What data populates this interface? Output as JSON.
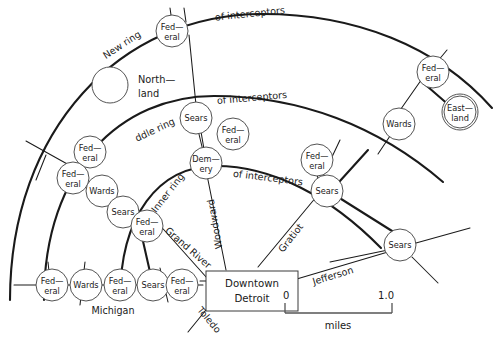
{
  "figure": {
    "kind": "ring-road-network-map",
    "region": "Detroit",
    "background_color": "#ffffff",
    "line_color": "#1a1a1a",
    "node_fill": "#ffffff",
    "node_stroke": "#4a4a4a"
  },
  "center": {
    "label_line1": "Downtown",
    "label_line2": "Detroit"
  },
  "rings": [
    {
      "id": "new-ring",
      "label": "New ring",
      "suffix_label": "of interceptors"
    },
    {
      "id": "middle-ring",
      "label": "ddle ring",
      "suffix_label": "of interceptors"
    },
    {
      "id": "inner-ring",
      "label": "Inner ring",
      "suffix_label": "of interceptors"
    }
  ],
  "radials": [
    {
      "id": "michigan",
      "label": "Michigan"
    },
    {
      "id": "grand-river",
      "label": "Grand River"
    },
    {
      "id": "woodward",
      "label": "Woodward"
    },
    {
      "id": "gratiot",
      "label": "Gratiot"
    },
    {
      "id": "jefferson",
      "label": "Jefferson"
    },
    {
      "id": "toledo",
      "label": "Toledo"
    }
  ],
  "unlabeled_circles": [
    {
      "id": "northland-circle",
      "note": "northland"
    },
    {
      "id": "eastland-circle",
      "note": "eastland"
    }
  ],
  "place_labels": [
    {
      "id": "northland",
      "line1": "North—",
      "line2": "land"
    }
  ],
  "nodes": [
    {
      "id": "n-federal-new-top",
      "line1": "Fed—",
      "line2": "eral",
      "store": "Federal"
    },
    {
      "id": "n-federal-new-right",
      "line1": "Fed—",
      "line2": "eral",
      "store": "Federal"
    },
    {
      "id": "n-eastland",
      "line1": "East—",
      "line2": "land",
      "store": "Eastland"
    },
    {
      "id": "n-sears-mid-top",
      "line1": "Sears",
      "line2": "",
      "store": "Sears"
    },
    {
      "id": "n-federal-mid-a",
      "line1": "Fed—",
      "line2": "eral",
      "store": "Federal"
    },
    {
      "id": "n-wards-mid-right",
      "line1": "Wards",
      "line2": "",
      "store": "Wards"
    },
    {
      "id": "n-federal-mid-right",
      "line1": "Fed—",
      "line2": "eral",
      "store": "Federal"
    },
    {
      "id": "n-sears-mid-right",
      "line1": "Sears",
      "line2": "",
      "store": "Sears"
    },
    {
      "id": "n-demery",
      "line1": "Dem—",
      "line2": "ery",
      "store": "Demery"
    },
    {
      "id": "n-federal-left-upper",
      "line1": "Fed—",
      "line2": "eral",
      "store": "Federal"
    },
    {
      "id": "n-federal-left-mid",
      "line1": "Fed—",
      "line2": "eral",
      "store": "Federal"
    },
    {
      "id": "n-wards-left",
      "line1": "Wards",
      "line2": "",
      "store": "Wards"
    },
    {
      "id": "n-sears-left",
      "line1": "Sears",
      "line2": "",
      "store": "Sears"
    },
    {
      "id": "n-federal-inner",
      "line1": "Fed—",
      "line2": "eral",
      "store": "Federal"
    },
    {
      "id": "n-sears-bottom-right",
      "line1": "Sears",
      "line2": "",
      "store": "Sears"
    },
    {
      "id": "n-federal-mich-1",
      "line1": "Fed—",
      "line2": "eral",
      "store": "Federal"
    },
    {
      "id": "n-wards-mich",
      "line1": "Wards",
      "line2": "",
      "store": "Wards"
    },
    {
      "id": "n-federal-mich-2",
      "line1": "Fed—",
      "line2": "eral",
      "store": "Federal"
    },
    {
      "id": "n-sears-mich",
      "line1": "Sears",
      "line2": "",
      "store": "Sears"
    },
    {
      "id": "n-federal-mich-3",
      "line1": "Fed—",
      "line2": "eral",
      "store": "Federal"
    }
  ],
  "scale_bar": {
    "min_label": "0",
    "max_label": "1.0",
    "unit_label": "miles"
  }
}
